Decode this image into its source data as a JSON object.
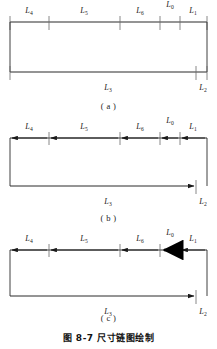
{
  "figure": {
    "caption": "图 8-7  尺寸链图绘制",
    "sub_labels": {
      "a": "( a )",
      "b": "( b )",
      "c": "( c )"
    }
  },
  "links": {
    "L4": {
      "base": "L",
      "sub": "4"
    },
    "L5": {
      "base": "L",
      "sub": "5"
    },
    "L6": {
      "base": "L",
      "sub": "6"
    },
    "L0": {
      "base": "L",
      "sub": "0"
    },
    "L1": {
      "base": "L",
      "sub": "1"
    },
    "L3": {
      "base": "L",
      "sub": "3"
    },
    "L2": {
      "base": "L",
      "sub": "2"
    }
  },
  "diagrams": [
    {
      "id": "a",
      "style": "plain-ticks",
      "top_chain": [
        "L4",
        "L5",
        "L6",
        "L0",
        "L1"
      ],
      "bottom_chain": [
        "L3",
        "L2"
      ],
      "arrows": false,
      "closing_link_emphasis": false
    },
    {
      "id": "b",
      "style": "dimension-arrows",
      "top_chain": [
        "L4",
        "L5",
        "L6",
        "L0",
        "L1"
      ],
      "bottom_chain": [
        "L3",
        "L2"
      ],
      "arrows": true,
      "closing_link_emphasis": false
    },
    {
      "id": "c",
      "style": "dimension-arrows-with-closing-link",
      "top_chain": [
        "L4",
        "L5",
        "L6",
        "L0",
        "L1"
      ],
      "bottom_chain": [
        "L3",
        "L2"
      ],
      "arrows": true,
      "closing_link_emphasis": true
    }
  ],
  "geometry": {
    "left_x": 10,
    "right_x": 207,
    "top_ticks": [
      10,
      49,
      120,
      160,
      180,
      207
    ],
    "bottom_ticks": [
      10,
      196,
      207
    ],
    "top_segment_labels_x": [
      29,
      84,
      140,
      170,
      193
    ],
    "bottom_segment_labels_x": [
      108,
      202
    ]
  },
  "colors": {
    "line": "#2b2b2b",
    "text": "#1a1a1a",
    "background": "#ffffff",
    "emphasis": "#000000"
  }
}
